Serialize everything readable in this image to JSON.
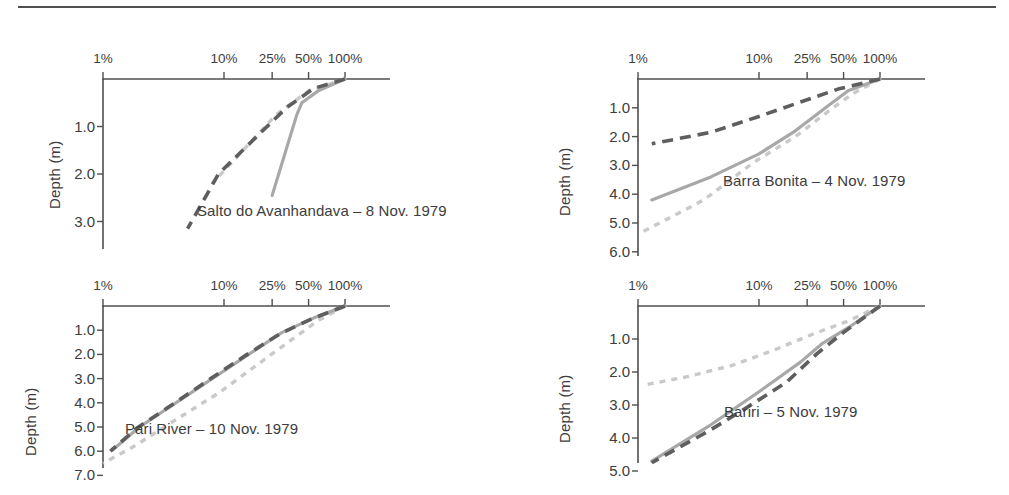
{
  "figure": {
    "ylabel": "Depth (m)",
    "xtick_labels": [
      "1%",
      "10%",
      "25%",
      "50%",
      "100%"
    ],
    "xtick_values": [
      1,
      10,
      25,
      50,
      100
    ],
    "series_names": [
      "solid-gray",
      "dark-dashed",
      "light-dotted"
    ],
    "colors": {
      "solid": "#a8a8a8",
      "dashed": "#5e5e5e",
      "dotted": "#c9c9c9",
      "axis": "#4f4f4f"
    }
  },
  "chart_data": [
    {
      "type": "line",
      "panel_id": "salto-do-avanhandava",
      "title": "Salto do Avanhandava – 8 Nov. 1979",
      "xlabel": "",
      "ylabel": "Depth (m)",
      "xscale": "log",
      "xlim": [
        1,
        100
      ],
      "xticks": [
        1,
        10,
        25,
        50,
        100
      ],
      "xticklabels": [
        "1%",
        "10%",
        "25%",
        "50%",
        "100%"
      ],
      "ylim": [
        0,
        3.5
      ],
      "yticks": [
        1.0,
        2.0,
        3.0
      ],
      "yticklabels": [
        "1.0",
        "2.0",
        "3.0"
      ],
      "grid": false,
      "legend": "none",
      "series": [
        {
          "name": "solid-gray",
          "style": "solid",
          "x": [
            100,
            60,
            44,
            40,
            25
          ],
          "y": [
            0.0,
            0.25,
            0.5,
            0.75,
            2.45
          ]
        },
        {
          "name": "dark-dashed",
          "style": "dashed",
          "x": [
            100,
            55,
            33,
            18,
            9,
            5
          ],
          "y": [
            0.0,
            0.2,
            0.6,
            1.25,
            2.0,
            3.15
          ]
        },
        {
          "name": "light-dotted",
          "style": "dotted",
          "x": [
            100,
            50,
            27,
            15,
            8
          ],
          "y": [
            0.0,
            0.25,
            0.75,
            1.45,
            2.2
          ]
        }
      ]
    },
    {
      "type": "line",
      "panel_id": "barra-bonita",
      "title": "Barra Bonita – 4 Nov. 1979",
      "xlabel": "",
      "ylabel": "Depth (m)",
      "xscale": "log",
      "xlim": [
        1,
        100
      ],
      "xticks": [
        1,
        10,
        25,
        50,
        100
      ],
      "xticklabels": [
        "1%",
        "10%",
        "25%",
        "50%",
        "100%"
      ],
      "ylim": [
        0,
        6.5
      ],
      "yticks": [
        1.0,
        2.0,
        3.0,
        4.0,
        5.0,
        6.0
      ],
      "yticklabels": [
        "1.0",
        "2.0",
        "3.0",
        "4.0",
        "5.0",
        "6.0"
      ],
      "grid": false,
      "legend": "none",
      "series": [
        {
          "name": "solid-gray",
          "style": "solid",
          "x": [
            100,
            55,
            38,
            20,
            10,
            4,
            1.3
          ],
          "y": [
            0.0,
            0.4,
            0.9,
            1.8,
            2.6,
            3.4,
            4.2
          ]
        },
        {
          "name": "dark-dashed",
          "style": "dashed",
          "x": [
            100,
            45,
            22,
            10,
            4,
            1.3
          ],
          "y": [
            0.0,
            0.35,
            0.8,
            1.3,
            1.85,
            2.25
          ]
        },
        {
          "name": "light-dotted",
          "style": "dotted",
          "x": [
            100,
            60,
            38,
            20,
            9,
            3.5,
            1.1
          ],
          "y": [
            0.0,
            0.5,
            1.1,
            2.0,
            2.9,
            4.2,
            5.3
          ]
        }
      ]
    },
    {
      "type": "line",
      "panel_id": "pari-river",
      "title": "Pari River – 10 Nov. 1979",
      "xlabel": "",
      "ylabel": "Depth (m)",
      "xscale": "log",
      "xlim": [
        1,
        100
      ],
      "xticks": [
        1,
        10,
        25,
        50,
        100
      ],
      "xticklabels": [
        "1%",
        "10%",
        "25%",
        "50%",
        "100%"
      ],
      "ylim": [
        0,
        7.6
      ],
      "yticks": [
        1.0,
        2.0,
        3.0,
        4.0,
        5.0,
        6.0,
        7.0
      ],
      "yticklabels": [
        "1.0",
        "2.0",
        "3.0",
        "4.0",
        "5.0",
        "6.0",
        "7.0"
      ],
      "grid": false,
      "legend": "none",
      "series": [
        {
          "name": "solid-gray",
          "style": "solid",
          "x": [
            100,
            55,
            30,
            16,
            8,
            4,
            2,
            1.2
          ],
          "y": [
            0.0,
            0.5,
            1.1,
            2.0,
            3.0,
            4.0,
            5.0,
            5.95
          ]
        },
        {
          "name": "dark-dashed",
          "style": "dashed",
          "x": [
            100,
            52,
            29,
            15,
            7.5,
            3.8,
            1.9,
            1.15
          ],
          "y": [
            0.0,
            0.55,
            1.15,
            2.05,
            3.05,
            4.05,
            5.05,
            6.0
          ]
        },
        {
          "name": "light-dotted",
          "style": "dotted",
          "x": [
            100,
            60,
            36,
            18,
            9,
            4,
            1.8,
            1.0
          ],
          "y": [
            0.0,
            0.6,
            1.4,
            2.5,
            3.6,
            4.7,
            5.8,
            6.5
          ]
        }
      ]
    },
    {
      "type": "line",
      "panel_id": "bariri",
      "title": "Bariri – 5 Nov. 1979",
      "xlabel": "",
      "ylabel": "Depth (m)",
      "xscale": "log",
      "xlim": [
        1,
        100
      ],
      "xticks": [
        1,
        10,
        25,
        50,
        100
      ],
      "xticklabels": [
        "1%",
        "10%",
        "25%",
        "50%",
        "100%"
      ],
      "ylim": [
        0,
        5.6
      ],
      "yticks": [
        1.0,
        2.0,
        3.0,
        4.0,
        5.0
      ],
      "yticklabels": [
        "1.0",
        "2.0",
        "3.0",
        "4.0",
        "5.0"
      ],
      "grid": false,
      "legend": "none",
      "series": [
        {
          "name": "solid-gray",
          "style": "solid",
          "x": [
            100,
            55,
            33,
            22,
            10,
            4,
            1.3
          ],
          "y": [
            0.0,
            0.65,
            1.15,
            1.7,
            2.6,
            3.6,
            4.7
          ]
        },
        {
          "name": "dark-dashed",
          "style": "dashed",
          "x": [
            100,
            50,
            30,
            17,
            9,
            4,
            1.3
          ],
          "y": [
            0.0,
            0.8,
            1.45,
            2.3,
            2.95,
            3.75,
            4.75
          ]
        },
        {
          "name": "light-dotted",
          "style": "dotted",
          "x": [
            100,
            55,
            28,
            13,
            6,
            2.5,
            1.1
          ],
          "y": [
            0.0,
            0.45,
            0.85,
            1.35,
            1.8,
            2.15,
            2.4
          ]
        }
      ]
    }
  ]
}
